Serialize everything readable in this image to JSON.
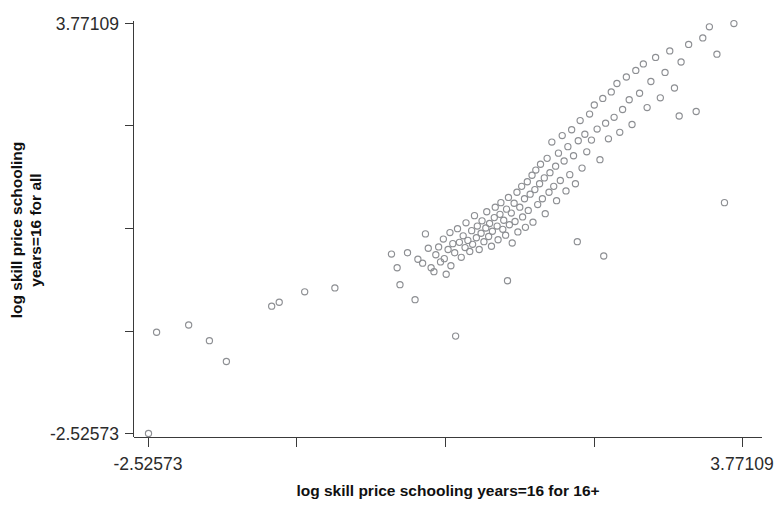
{
  "chart_data": {
    "type": "scatter",
    "title": "",
    "xlabel": "log skill price schooling years=16 for 16+",
    "ylabel": "log skill price schooling years=16 for all",
    "ylabel_line1": "log skill price schooling",
    "ylabel_line2": "years=16 for all",
    "xlim": [
      -2.52573,
      3.77109
    ],
    "ylim": [
      -2.52573,
      3.77109
    ],
    "x_tick_labels": [
      "-2.52573",
      "3.77109"
    ],
    "y_tick_labels": [
      "3.77109",
      "-2.52573"
    ],
    "x_tick_values": [
      -2.52573,
      -1.0,
      0.5,
      2.1,
      3.77109
    ],
    "y_tick_values": [
      3.77109,
      2.2,
      0.6,
      -0.95,
      -2.52573
    ],
    "grid": false,
    "legend": null,
    "marker": "open-circle",
    "marker_color": "#8d8f93",
    "background_color": "#ffffff",
    "axis_color": "#3a3a3a",
    "n_points": 146,
    "points": [
      [
        -2.52573,
        -2.52573
      ],
      [
        -2.44,
        -0.97
      ],
      [
        -2.1,
        -0.86
      ],
      [
        -1.88,
        -1.1
      ],
      [
        -1.7,
        -1.42
      ],
      [
        -1.22,
        -0.57
      ],
      [
        -1.14,
        -0.51
      ],
      [
        -0.87,
        -0.35
      ],
      [
        -0.55,
        -0.29
      ],
      [
        0.05,
        0.23
      ],
      [
        0.11,
        0.02
      ],
      [
        0.14,
        -0.24
      ],
      [
        0.22,
        0.25
      ],
      [
        0.3,
        -0.47
      ],
      [
        0.33,
        0.15
      ],
      [
        0.38,
        0.09
      ],
      [
        0.41,
        0.54
      ],
      [
        0.44,
        0.32
      ],
      [
        0.47,
        0.02
      ],
      [
        0.5,
        -0.04
      ],
      [
        0.52,
        0.22
      ],
      [
        0.55,
        0.34
      ],
      [
        0.57,
        0.11
      ],
      [
        0.6,
        0.46
      ],
      [
        0.61,
        0.16
      ],
      [
        0.63,
        -0.08
      ],
      [
        0.65,
        0.3
      ],
      [
        0.67,
        0.56
      ],
      [
        0.68,
        0.05
      ],
      [
        0.7,
        0.39
      ],
      [
        0.72,
        0.25
      ],
      [
        0.73,
        -1.03
      ],
      [
        0.75,
        0.62
      ],
      [
        0.77,
        0.41
      ],
      [
        0.79,
        0.18
      ],
      [
        0.81,
        0.51
      ],
      [
        0.83,
        0.33
      ],
      [
        0.84,
        0.71
      ],
      [
        0.86,
        0.44
      ],
      [
        0.88,
        0.27
      ],
      [
        0.9,
        0.59
      ],
      [
        0.91,
        0.38
      ],
      [
        0.93,
        0.82
      ],
      [
        0.95,
        0.48
      ],
      [
        0.96,
        0.66
      ],
      [
        0.98,
        0.3
      ],
      [
        1.0,
        0.55
      ],
      [
        1.01,
        0.74
      ],
      [
        1.03,
        0.42
      ],
      [
        1.05,
        0.63
      ],
      [
        1.06,
        0.88
      ],
      [
        1.08,
        0.5
      ],
      [
        1.09,
        0.7
      ],
      [
        1.11,
        0.35
      ],
      [
        1.12,
        0.58
      ],
      [
        1.14,
        0.79
      ],
      [
        1.15,
        0.95
      ],
      [
        1.17,
        0.66
      ],
      [
        1.18,
        0.45
      ],
      [
        1.2,
        0.84
      ],
      [
        1.21,
        1.02
      ],
      [
        1.23,
        0.61
      ],
      [
        1.24,
        0.75
      ],
      [
        1.26,
        0.52
      ],
      [
        1.27,
        0.92
      ],
      [
        1.29,
        1.1
      ],
      [
        1.3,
        0.68
      ],
      [
        1.32,
        0.86
      ],
      [
        1.33,
        0.4
      ],
      [
        1.35,
        1.01
      ],
      [
        1.36,
        0.73
      ],
      [
        1.38,
        1.18
      ],
      [
        1.39,
        0.57
      ],
      [
        1.41,
        0.95
      ],
      [
        1.43,
        1.27
      ],
      [
        1.44,
        0.8
      ],
      [
        1.46,
        1.08
      ],
      [
        1.47,
        0.64
      ],
      [
        1.49,
        1.34
      ],
      [
        1.5,
        0.9
      ],
      [
        1.52,
        1.15
      ],
      [
        1.54,
        1.44
      ],
      [
        1.55,
        0.72
      ],
      [
        1.57,
        1.22
      ],
      [
        1.58,
        1.52
      ],
      [
        1.6,
        0.99
      ],
      [
        1.62,
        1.31
      ],
      [
        1.63,
        1.61
      ],
      [
        1.65,
        1.08
      ],
      [
        1.67,
        1.4
      ],
      [
        1.68,
        0.85
      ],
      [
        1.7,
        1.7
      ],
      [
        1.72,
        1.18
      ],
      [
        1.73,
        1.48
      ],
      [
        1.75,
        1.95
      ],
      [
        1.77,
        1.27
      ],
      [
        1.79,
        1.58
      ],
      [
        1.8,
        1.05
      ],
      [
        1.82,
        1.78
      ],
      [
        1.84,
        1.36
      ],
      [
        1.86,
        2.05
      ],
      [
        1.88,
        1.66
      ],
      [
        1.9,
        1.2
      ],
      [
        1.92,
        1.88
      ],
      [
        1.94,
        1.45
      ],
      [
        1.96,
        2.14
      ],
      [
        1.98,
        1.74
      ],
      [
        2.0,
        1.31
      ],
      [
        2.03,
        1.97
      ],
      [
        2.05,
        2.28
      ],
      [
        2.07,
        1.55
      ],
      [
        2.1,
        2.07
      ],
      [
        2.12,
        1.8
      ],
      [
        2.15,
        2.38
      ],
      [
        2.17,
        1.98
      ],
      [
        2.2,
        2.52
      ],
      [
        2.23,
        2.15
      ],
      [
        2.26,
        1.68
      ],
      [
        2.29,
        2.62
      ],
      [
        2.32,
        2.24
      ],
      [
        2.35,
        2.0
      ],
      [
        2.38,
        2.72
      ],
      [
        2.41,
        2.33
      ],
      [
        2.44,
        2.85
      ],
      [
        2.47,
        2.1
      ],
      [
        2.5,
        2.45
      ],
      [
        2.54,
        2.95
      ],
      [
        2.57,
        2.6
      ],
      [
        2.6,
        2.22
      ],
      [
        2.64,
        3.05
      ],
      [
        2.68,
        2.7
      ],
      [
        2.72,
        3.15
      ],
      [
        2.76,
        2.48
      ],
      [
        2.8,
        2.88
      ],
      [
        2.85,
        3.25
      ],
      [
        2.9,
        2.63
      ],
      [
        2.95,
        3.02
      ],
      [
        3.0,
        3.35
      ],
      [
        3.05,
        2.78
      ],
      [
        3.12,
        3.18
      ],
      [
        3.2,
        3.45
      ],
      [
        3.28,
        2.42
      ],
      [
        3.35,
        3.55
      ],
      [
        3.42,
        3.72
      ],
      [
        3.5,
        3.3
      ],
      [
        3.58,
        1.02
      ],
      [
        3.68,
        3.77
      ],
      [
        2.02,
        0.42
      ],
      [
        2.3,
        0.2
      ],
      [
        1.28,
        -0.18
      ],
      [
        3.1,
        2.35
      ]
    ]
  }
}
